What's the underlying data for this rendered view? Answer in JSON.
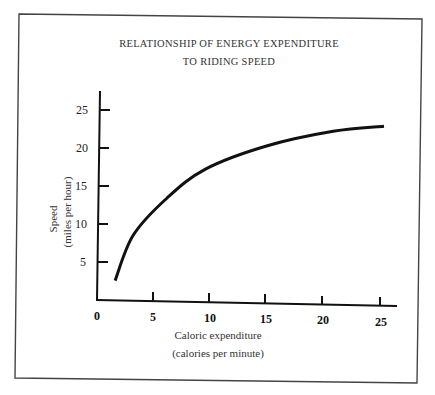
{
  "chart_data": {
    "type": "line",
    "title": "RELATIONSHIP OF ENERGY EXPENDITURE TO RIDING SPEED",
    "title_lines": [
      "RELATIONSHIP OF ENERGY EXPENDITURE",
      "TO RIDING SPEED"
    ],
    "xlabel": "Caloric expenditure",
    "xlabel_sub": "(calories per minute)",
    "ylabel": "Speed",
    "ylabel_sub": "(miles per hour)",
    "x_ticks": [
      0,
      5,
      10,
      15,
      20,
      25
    ],
    "x_tick_labels": [
      "0",
      "5",
      "10",
      "15",
      "20",
      "25"
    ],
    "y_ticks": [
      5,
      10,
      15,
      20,
      25
    ],
    "y_tick_labels": [
      "5",
      "10",
      "15",
      "20",
      "25"
    ],
    "xlim": [
      0,
      27
    ],
    "ylim": [
      0,
      27
    ],
    "grid": false,
    "legend": null,
    "series": [
      {
        "name": "Speed vs caloric expenditure",
        "x": [
          1.6,
          3.2,
          6.2,
          9.6,
          15.0,
          20.9,
          25.4
        ],
        "y": [
          2.6,
          8.6,
          13.6,
          17.5,
          20.7,
          22.8,
          23.6
        ]
      }
    ]
  }
}
